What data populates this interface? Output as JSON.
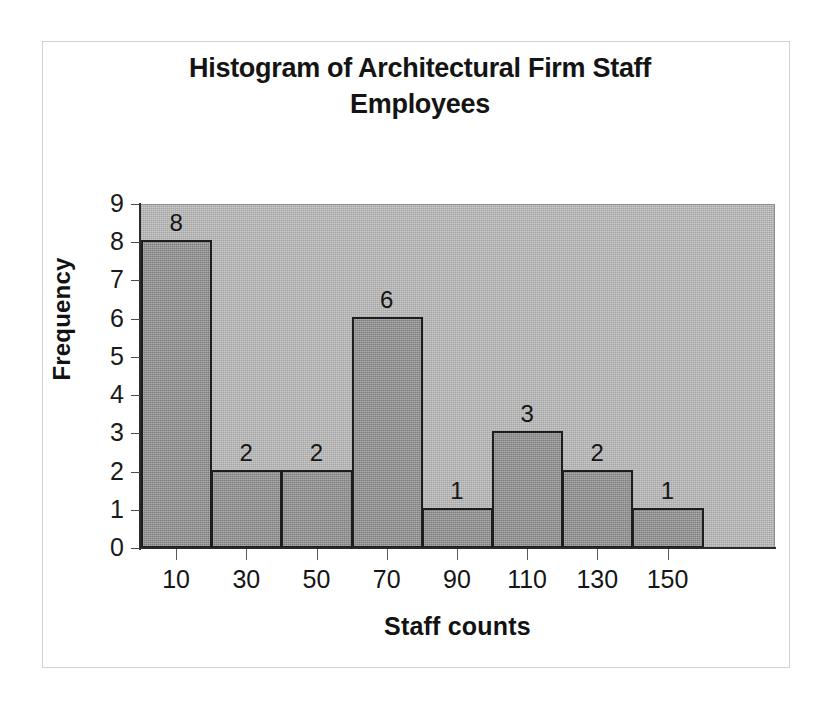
{
  "chart_data": {
    "type": "bar",
    "title": "Histogram of Architectural Firm Staff Employees",
    "title_lines": [
      "Histogram of Architectural Firm Staff",
      "Employees"
    ],
    "xlabel": "Staff counts",
    "ylabel": "Frequency",
    "categories": [
      "10",
      "30",
      "50",
      "70",
      "90",
      "110",
      "130",
      "150"
    ],
    "values": [
      8,
      2,
      2,
      6,
      1,
      3,
      2,
      1
    ],
    "data_labels": [
      "8",
      "2",
      "2",
      "6",
      "1",
      "3",
      "2",
      "1"
    ],
    "ylim": [
      0,
      9
    ],
    "ytick_labels": [
      "0",
      "1",
      "2",
      "3",
      "4",
      "5",
      "6",
      "7",
      "8",
      "9"
    ],
    "grid": false,
    "legend": false,
    "colors": {
      "bar_fill": "#9a9a9a",
      "bar_border": "#1d1d1d",
      "plot_background": "#b5b5b5",
      "figure_background": "#ffffff",
      "frame_border": "#d2d2d2",
      "axis": "#2b2b2b",
      "text": "#141414"
    }
  }
}
